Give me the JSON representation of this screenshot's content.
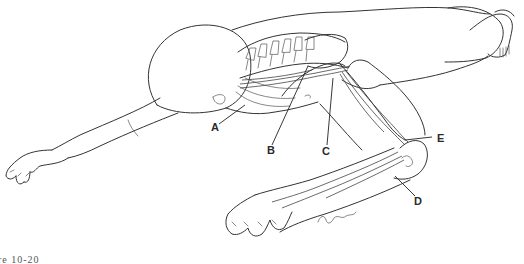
{
  "figure": {
    "type": "anatomical line drawing",
    "caption_fragment": "re 10-20",
    "signature": "signature (illegible)"
  },
  "labels": [
    {
      "id": "A",
      "text": "A",
      "x": 211,
      "y": 122
    },
    {
      "id": "B",
      "text": "B",
      "x": 267,
      "y": 145
    },
    {
      "id": "C",
      "text": "C",
      "x": 322,
      "y": 146
    },
    {
      "id": "D",
      "text": "D",
      "x": 414,
      "y": 196
    },
    {
      "id": "E",
      "text": "E",
      "x": 437,
      "y": 133
    }
  ],
  "colors": {
    "ink": "#333333",
    "background": "#ffffff",
    "label": "#2a2a2a"
  }
}
